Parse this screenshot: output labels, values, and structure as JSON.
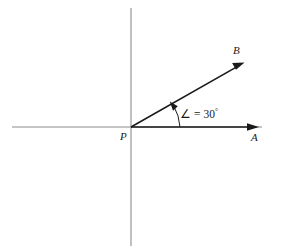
{
  "figure": {
    "background_color": "#ffffff",
    "axis_color": "#8c8c8c",
    "ray_color": "#1a1a1a",
    "vertex": {
      "label": "P",
      "x": 131,
      "y": 127
    },
    "axes": {
      "horizontal": {
        "x1": 12,
        "y1": 127,
        "x2": 262,
        "y2": 127
      },
      "vertical": {
        "x1": 131,
        "y1": 8,
        "x2": 131,
        "y2": 246
      }
    },
    "rays": [
      {
        "label": "A",
        "name": "ray-pa",
        "from_x": 131,
        "from_y": 127,
        "to_x": 258,
        "to_y": 127,
        "angle_degrees": 0,
        "label_x": 251,
        "label_y": 140
      },
      {
        "label": "B",
        "name": "ray-pb",
        "from_x": 131,
        "from_y": 127,
        "to_x": 243,
        "to_y": 63,
        "angle_degrees": 30,
        "label_x": 233,
        "label_y": 53
      }
    ],
    "angle_arc": {
      "label_symbol": "∠",
      "label_equals": "=",
      "label_value": "30",
      "label_unit": "°",
      "label_full": "∠ = 30°",
      "label_x": 180,
      "label_y": 118,
      "radius": 49,
      "start_x": 180,
      "start_y": 127,
      "end_x": 173,
      "end_y": 105
    }
  }
}
